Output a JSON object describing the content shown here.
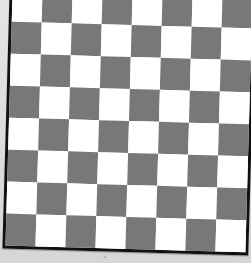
{
  "image": {
    "subject": "checkerboard",
    "rows": 8,
    "columns": 8,
    "top_left_color": "light",
    "colors": {
      "light": "#ffffff",
      "dark": "#787878",
      "border": "#111111",
      "background": "#d9d9d9"
    },
    "rotation_deg": 1.6,
    "bottom_mark": "¨"
  }
}
